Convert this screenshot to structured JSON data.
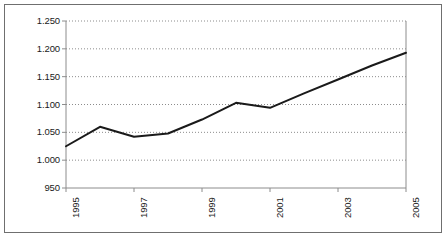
{
  "chart_data": {
    "type": "line",
    "title": "",
    "xlabel": "",
    "ylabel": "",
    "x": [
      1995,
      1996,
      1997,
      1998,
      1999,
      2000,
      2001,
      2002,
      2003,
      2004,
      2005
    ],
    "values": [
      1025,
      1060,
      1042,
      1048,
      1073,
      1103,
      1094,
      1120,
      1145,
      1170,
      1193
    ],
    "series": [
      {
        "name": "",
        "values": [
          1025,
          1060,
          1042,
          1048,
          1073,
          1103,
          1094,
          1120,
          1145,
          1170,
          1193
        ]
      }
    ],
    "ylim": [
      950,
      1250
    ],
    "xlim": [
      1995,
      2005
    ],
    "ytick_values": [
      950,
      1000,
      1050,
      1100,
      1150,
      1200,
      1250
    ],
    "ytick_labels": [
      "950",
      "1.000",
      "1.050",
      "1.100",
      "1.150",
      "1.200",
      "1.250"
    ],
    "xtick_values": [
      1995,
      1997,
      1999,
      2001,
      2003,
      2005
    ],
    "xtick_labels": [
      "1995",
      "1997",
      "1999",
      "2001",
      "2003",
      "2005"
    ],
    "grid": "horizontal-dotted",
    "legend": "none",
    "line_color": "#1a1a1a",
    "grid_color": "#8c8c8c",
    "axis_color": "#8c8c8c",
    "border_color": "#6f6f6f",
    "background_color": "#ffffff",
    "line_width": 2
  }
}
